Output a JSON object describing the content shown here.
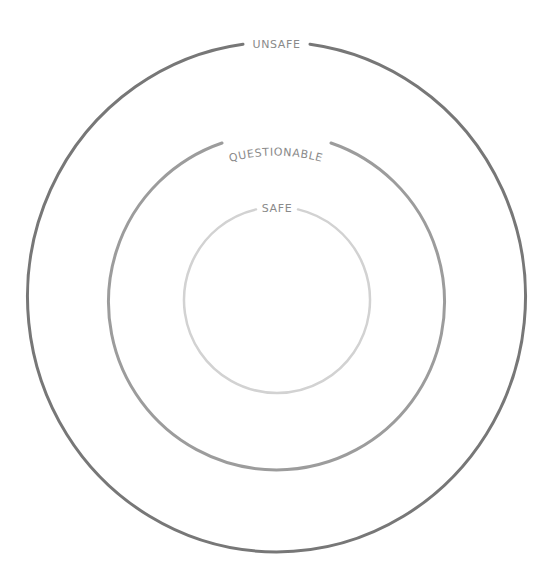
{
  "diagram": {
    "type": "concentric-circles",
    "rings": [
      {
        "id": "unsafe",
        "label": "UNSAFE",
        "color": "#777777",
        "cx": 276,
        "cy": 298,
        "rx": 249,
        "ry": 255,
        "stroke_width": 3
      },
      {
        "id": "questionable",
        "label": "QUESTIONABLE",
        "color": "#9c9c9c",
        "cx": 276,
        "cy": 302,
        "rx": 168,
        "ry": 168,
        "stroke_width": 3
      },
      {
        "id": "safe",
        "label": "SAFE",
        "color": "#d2d2d2",
        "cx": 277,
        "cy": 300,
        "rx": 93,
        "ry": 93,
        "stroke_width": 2.5
      }
    ],
    "labels": {
      "unsafe": "UNSAFE",
      "questionable": "QUESTIONABLE",
      "safe": "SAFE"
    }
  }
}
